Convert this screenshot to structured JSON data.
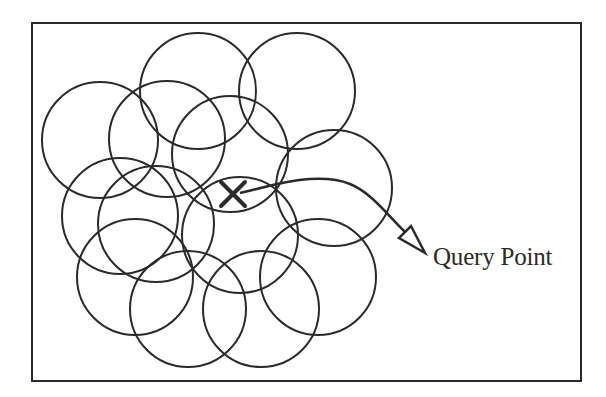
{
  "figure": {
    "query_label": "Query Point",
    "colors": {
      "background": "#ffffff",
      "stroke": "#2a2a2a"
    },
    "frame": {
      "x": 32,
      "y": 23,
      "width": 549,
      "height": 358
    },
    "circle_radius": 58,
    "circles": [
      {
        "id": "A",
        "cx": 100,
        "cy": 140
      },
      {
        "id": "B",
        "cx": 198,
        "cy": 91
      },
      {
        "id": "C",
        "cx": 167,
        "cy": 139
      },
      {
        "id": "D",
        "cx": 297,
        "cy": 91
      },
      {
        "id": "E",
        "cx": 230,
        "cy": 154
      },
      {
        "id": "F",
        "cx": 334,
        "cy": 188
      },
      {
        "id": "G",
        "cx": 120,
        "cy": 216
      },
      {
        "id": "H",
        "cx": 156,
        "cy": 224
      },
      {
        "id": "K",
        "cx": 240,
        "cy": 235
      },
      {
        "id": "I",
        "cx": 135,
        "cy": 277
      },
      {
        "id": "J",
        "cx": 188,
        "cy": 309
      },
      {
        "id": "L",
        "cx": 261,
        "cy": 309
      },
      {
        "id": "M",
        "cx": 318,
        "cy": 277
      }
    ],
    "query_marker": {
      "x": 233,
      "y": 194,
      "size": 12,
      "symbol": "cross"
    },
    "arrow": {
      "path": "M 240 193 L 277 184 C 300 179 330 176 350 184 C 370 192 385 212 405 232",
      "tip": {
        "x": 425,
        "y": 253
      },
      "head_left": {
        "x": 399,
        "y": 238
      },
      "head_right": {
        "x": 411,
        "y": 226
      }
    }
  }
}
